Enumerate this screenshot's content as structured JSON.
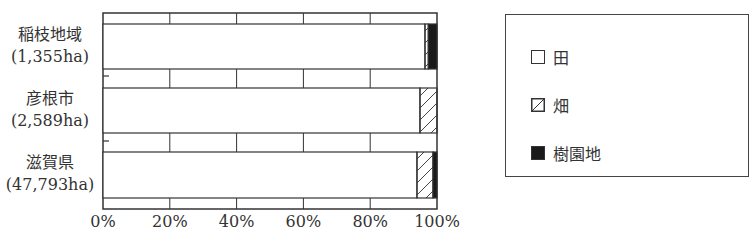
{
  "chart_data": {
    "type": "bar",
    "orientation": "horizontal",
    "stacked": true,
    "percent": true,
    "categories": [
      {
        "name": "稲枝地域",
        "area": "(1,355ha)"
      },
      {
        "name": "彦根市",
        "area": "(2,589ha)"
      },
      {
        "name": "滋賀県",
        "area": "(47,793ha)"
      }
    ],
    "series": [
      {
        "name": "田",
        "pattern": "blank",
        "values": [
          96.4,
          94.9,
          94.0
        ]
      },
      {
        "name": "畑",
        "pattern": "hatch",
        "values": [
          1.0,
          5.1,
          4.8
        ]
      },
      {
        "name": "樹園地",
        "pattern": "solid",
        "values": [
          2.6,
          0.0,
          1.2
        ]
      }
    ],
    "xlim": [
      0,
      100
    ],
    "xticks": [
      "0%",
      "20%",
      "40%",
      "60%",
      "80%",
      "100%"
    ],
    "xtick_values": [
      0,
      20,
      40,
      60,
      80,
      100
    ],
    "title": "",
    "xlabel": "",
    "ylabel": "",
    "legend_position": "right"
  },
  "colors": {
    "line": "#333333",
    "solid_fill": "#1a1a1a",
    "blank_fill": "#ffffff"
  }
}
